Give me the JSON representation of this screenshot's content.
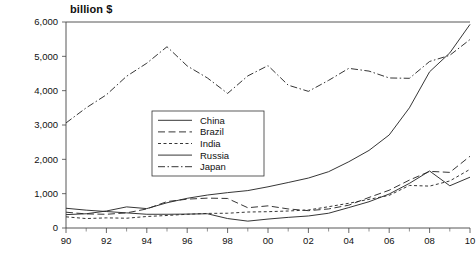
{
  "chart_data": {
    "type": "line",
    "title": "billion $",
    "xlabel": "",
    "ylabel": "",
    "ylim": [
      0,
      6000
    ],
    "xlim": [
      1990,
      2010
    ],
    "grid": false,
    "legend_position": "inside-center-left",
    "y_ticks": [
      0,
      1000,
      2000,
      3000,
      4000,
      5000,
      6000
    ],
    "y_tick_labels": [
      "0",
      "1,000",
      "2,000",
      "3,000",
      "4,000",
      "5,000",
      "6,000"
    ],
    "x_ticks": [
      1990,
      1992,
      1994,
      1996,
      1998,
      2000,
      2002,
      2004,
      2006,
      2008,
      2010
    ],
    "x_tick_labels": [
      "90",
      "92",
      "94",
      "96",
      "98",
      "00",
      "02",
      "04",
      "06",
      "08",
      "10"
    ],
    "x": [
      1990,
      1991,
      1992,
      1993,
      1994,
      1995,
      1996,
      1997,
      1998,
      1999,
      2000,
      2001,
      2002,
      2003,
      2004,
      2005,
      2006,
      2007,
      2008,
      2009,
      2010
    ],
    "series": [
      {
        "name": "China",
        "dash": "solid",
        "values": [
          390,
          415,
          495,
          615,
          565,
          735,
          865,
          960,
          1030,
          1090,
          1200,
          1325,
          1455,
          1640,
          1930,
          2260,
          2710,
          3500,
          4550,
          5100,
          5930
        ]
      },
      {
        "name": "Brazil",
        "dash": "long-dash",
        "values": [
          460,
          410,
          400,
          440,
          555,
          770,
          840,
          870,
          860,
          590,
          645,
          555,
          505,
          555,
          665,
          890,
          1100,
          1395,
          1650,
          1620,
          2090
        ]
      },
      {
        "name": "India",
        "dash": "short-dash",
        "values": [
          325,
          275,
          295,
          285,
          335,
          365,
          400,
          425,
          430,
          465,
          475,
          495,
          525,
          620,
          720,
          835,
          950,
          1240,
          1220,
          1370,
          1710
        ]
      },
      {
        "name": "Russia",
        "dash": "solid",
        "values": [
          575,
          520,
          480,
          440,
          400,
          400,
          405,
          415,
          275,
          200,
          260,
          310,
          350,
          430,
          595,
          765,
          990,
          1300,
          1660,
          1230,
          1480
        ]
      },
      {
        "name": "Japan",
        "dash": "dash-dot",
        "values": [
          3060,
          3500,
          3880,
          4420,
          4800,
          5280,
          4720,
          4370,
          3920,
          4430,
          4730,
          4160,
          3980,
          4300,
          4650,
          4570,
          4370,
          4360,
          4850,
          5030,
          5490
        ]
      }
    ]
  },
  "legend": {
    "entries": [
      {
        "label": "China"
      },
      {
        "label": "Brazil"
      },
      {
        "label": "India"
      },
      {
        "label": "Russia"
      },
      {
        "label": "Japan"
      }
    ]
  }
}
